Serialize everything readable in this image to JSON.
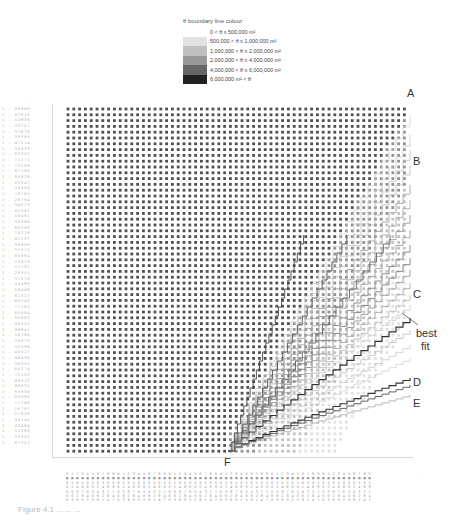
{
  "legend": {
    "title": "θ boundary line colour:",
    "items": [
      {
        "label": "0 < θ ≤ 500,000 m²",
        "color": "#ffffff"
      },
      {
        "label": "500,000 < θ ≤ 1,000,000 m²",
        "color": "#e2e2e2"
      },
      {
        "label": "1,000,000 < θ ≤ 2,000,000 m²",
        "color": "#c0c0c0"
      },
      {
        "label": "2,000,000 < θ ≤ 4,000,000 m²",
        "color": "#999999"
      },
      {
        "label": "4,000,000 < θ ≤ 6,000,000 m²",
        "color": "#666666"
      },
      {
        "label": "6,000,000 m² < θ",
        "color": "#222222"
      }
    ]
  },
  "markers": {
    "A": "A",
    "B": "B",
    "C": "C",
    "best_fit": "best",
    "best_fit_2": "fit",
    "D": "D",
    "E": "E",
    "F": "F"
  },
  "axes": {
    "y_unit": "· · · ·",
    "x_unit": "· · · · ·",
    "y_tick_count": 60,
    "x_tick_count": 60
  },
  "caption": "Figure 4.1  ...  ...  ...",
  "colors": {
    "dot": "#555555",
    "line_dark": "#333333",
    "line_light": "#bdbdbd"
  }
}
